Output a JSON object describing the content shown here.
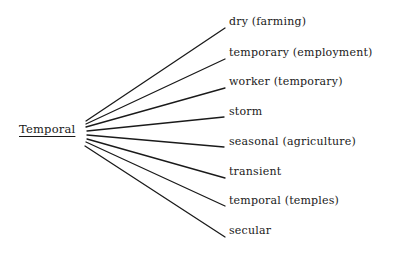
{
  "diagram": {
    "type": "fan-out tree",
    "root": {
      "label": "Temporal",
      "underlined": true
    },
    "branches": [
      {
        "label": "dry (farming)",
        "y": 22
      },
      {
        "label": "temporary (employment)",
        "y": 53
      },
      {
        "label": "worker (temporary)",
        "y": 82
      },
      {
        "label": "storm",
        "y": 111
      },
      {
        "label": "seasonal (agriculture)",
        "y": 141
      },
      {
        "label": "transient",
        "y": 171
      },
      {
        "label": "temporal (temples)",
        "y": 200
      },
      {
        "label": "secular",
        "y": 230
      }
    ],
    "line_color": "#1a1a1a"
  }
}
